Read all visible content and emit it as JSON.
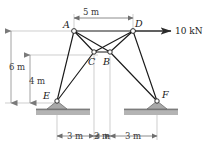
{
  "figure": {
    "background_color": "#ffffff",
    "member_color": "#1a1a1a",
    "dimension_color": "#8a8a8a",
    "support_fill": "#a8a8a8",
    "ground_color": "#b0b0b0"
  },
  "nodes": {
    "A": {
      "label": "A",
      "x_m": 0,
      "y_m": 6,
      "px": 74,
      "py": 31
    },
    "D": {
      "label": "D",
      "x_m": 5,
      "y_m": 6,
      "px": 133,
      "py": 31
    },
    "C": {
      "label": "C",
      "x_m": 2,
      "y_m": 4,
      "px": 94,
      "py": 52
    },
    "B": {
      "label": "B",
      "x_m": 3,
      "y_m": 4,
      "px": 110,
      "py": 52
    },
    "E": {
      "label": "E",
      "x_m": -1,
      "y_m": 0,
      "px": 57,
      "py": 101
    },
    "F": {
      "label": "F",
      "x_m": 7,
      "y_m": 0,
      "px": 157,
      "py": 101
    }
  },
  "members": [
    {
      "name": "A-D",
      "from": "A",
      "to": "D"
    },
    {
      "name": "A-C",
      "from": "A",
      "to": "C"
    },
    {
      "name": "A-B",
      "from": "A",
      "to": "B"
    },
    {
      "name": "A-E",
      "from": "A",
      "to": "E"
    },
    {
      "name": "D-C",
      "from": "D",
      "to": "C"
    },
    {
      "name": "D-B",
      "from": "D",
      "to": "B"
    },
    {
      "name": "D-F",
      "from": "D",
      "to": "F"
    },
    {
      "name": "C-E",
      "from": "C",
      "to": "E"
    },
    {
      "name": "B-F",
      "from": "B",
      "to": "F"
    },
    {
      "name": "C-B",
      "from": "C",
      "to": "B"
    }
  ],
  "supports": [
    {
      "name": "support-E",
      "at": "E",
      "type": "pin"
    },
    {
      "name": "support-F",
      "at": "F",
      "type": "pin"
    }
  ],
  "load": {
    "label": "10 kN",
    "magnitude": 10,
    "unit": "kN",
    "direction": "right",
    "applied_at": "D"
  },
  "dimensions": {
    "top": {
      "label": "5 m",
      "value": 5,
      "unit": "m",
      "from": "A",
      "to": "D"
    },
    "left_outer": {
      "label": "6 m",
      "value": 6,
      "unit": "m"
    },
    "left_inner": {
      "label": "4 m",
      "value": 4,
      "unit": "m"
    },
    "bottom": [
      {
        "label": "3 m",
        "value": 3,
        "unit": "m"
      },
      {
        "label": "2 m",
        "value": 2,
        "unit": "m"
      },
      {
        "label": "3 m",
        "value": 3,
        "unit": "m"
      }
    ]
  }
}
